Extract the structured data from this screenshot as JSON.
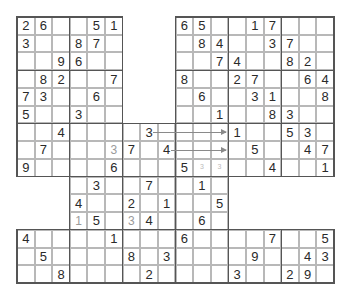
{
  "puzzle": {
    "type": "overlapping sudoku",
    "columns": 18,
    "rows": 15,
    "givens": [
      {
        "r": 0,
        "c": 0,
        "v": "2"
      },
      {
        "r": 0,
        "c": 1,
        "v": "6"
      },
      {
        "r": 0,
        "c": 4,
        "v": "5"
      },
      {
        "r": 0,
        "c": 5,
        "v": "1"
      },
      {
        "r": 0,
        "c": 9,
        "v": "6"
      },
      {
        "r": 0,
        "c": 10,
        "v": "5"
      },
      {
        "r": 0,
        "c": 13,
        "v": "1"
      },
      {
        "r": 0,
        "c": 14,
        "v": "7"
      },
      {
        "r": 1,
        "c": 0,
        "v": "3"
      },
      {
        "r": 1,
        "c": 3,
        "v": "8"
      },
      {
        "r": 1,
        "c": 4,
        "v": "7"
      },
      {
        "r": 1,
        "c": 10,
        "v": "8"
      },
      {
        "r": 1,
        "c": 11,
        "v": "4"
      },
      {
        "r": 1,
        "c": 14,
        "v": "3"
      },
      {
        "r": 1,
        "c": 15,
        "v": "7"
      },
      {
        "r": 2,
        "c": 2,
        "v": "9"
      },
      {
        "r": 2,
        "c": 3,
        "v": "6"
      },
      {
        "r": 2,
        "c": 11,
        "v": "7"
      },
      {
        "r": 2,
        "c": 12,
        "v": "4"
      },
      {
        "r": 2,
        "c": 15,
        "v": "8"
      },
      {
        "r": 2,
        "c": 16,
        "v": "2"
      },
      {
        "r": 3,
        "c": 1,
        "v": "8"
      },
      {
        "r": 3,
        "c": 2,
        "v": "2"
      },
      {
        "r": 3,
        "c": 5,
        "v": "7"
      },
      {
        "r": 3,
        "c": 9,
        "v": "8"
      },
      {
        "r": 3,
        "c": 12,
        "v": "2"
      },
      {
        "r": 3,
        "c": 13,
        "v": "7"
      },
      {
        "r": 3,
        "c": 16,
        "v": "6"
      },
      {
        "r": 3,
        "c": 17,
        "v": "4"
      },
      {
        "r": 4,
        "c": 0,
        "v": "7"
      },
      {
        "r": 4,
        "c": 1,
        "v": "3"
      },
      {
        "r": 4,
        "c": 4,
        "v": "6"
      },
      {
        "r": 4,
        "c": 10,
        "v": "6"
      },
      {
        "r": 4,
        "c": 13,
        "v": "3"
      },
      {
        "r": 4,
        "c": 14,
        "v": "1"
      },
      {
        "r": 4,
        "c": 17,
        "v": "8"
      },
      {
        "r": 5,
        "c": 0,
        "v": "5"
      },
      {
        "r": 5,
        "c": 3,
        "v": "3"
      },
      {
        "r": 5,
        "c": 11,
        "v": "1"
      },
      {
        "r": 5,
        "c": 14,
        "v": "8"
      },
      {
        "r": 5,
        "c": 15,
        "v": "3"
      },
      {
        "r": 6,
        "c": 2,
        "v": "4"
      },
      {
        "r": 6,
        "c": 7,
        "v": "3"
      },
      {
        "r": 6,
        "c": 12,
        "v": "1"
      },
      {
        "r": 6,
        "c": 15,
        "v": "5"
      },
      {
        "r": 6,
        "c": 16,
        "v": "3"
      },
      {
        "r": 7,
        "c": 1,
        "v": "7"
      },
      {
        "r": 7,
        "c": 6,
        "v": "7"
      },
      {
        "r": 7,
        "c": 8,
        "v": "4"
      },
      {
        "r": 7,
        "c": 13,
        "v": "5"
      },
      {
        "r": 7,
        "c": 16,
        "v": "4"
      },
      {
        "r": 7,
        "c": 17,
        "v": "7"
      },
      {
        "r": 8,
        "c": 0,
        "v": "9"
      },
      {
        "r": 8,
        "c": 5,
        "v": "6"
      },
      {
        "r": 8,
        "c": 9,
        "v": "5"
      },
      {
        "r": 8,
        "c": 14,
        "v": "4"
      },
      {
        "r": 8,
        "c": 17,
        "v": "1"
      },
      {
        "r": 9,
        "c": 4,
        "v": "3"
      },
      {
        "r": 9,
        "c": 7,
        "v": "7"
      },
      {
        "r": 9,
        "c": 10,
        "v": "1"
      },
      {
        "r": 10,
        "c": 3,
        "v": "4"
      },
      {
        "r": 10,
        "c": 6,
        "v": "2"
      },
      {
        "r": 10,
        "c": 8,
        "v": "1"
      },
      {
        "r": 10,
        "c": 11,
        "v": "5"
      },
      {
        "r": 11,
        "c": 4,
        "v": "5"
      },
      {
        "r": 11,
        "c": 7,
        "v": "4"
      },
      {
        "r": 11,
        "c": 10,
        "v": "6"
      },
      {
        "r": 12,
        "c": 0,
        "v": "4"
      },
      {
        "r": 12,
        "c": 5,
        "v": "1"
      },
      {
        "r": 12,
        "c": 9,
        "v": "6"
      },
      {
        "r": 12,
        "c": 14,
        "v": "7"
      },
      {
        "r": 12,
        "c": 17,
        "v": "5"
      },
      {
        "r": 13,
        "c": 1,
        "v": "5"
      },
      {
        "r": 13,
        "c": 6,
        "v": "8"
      },
      {
        "r": 13,
        "c": 8,
        "v": "3"
      },
      {
        "r": 13,
        "c": 13,
        "v": "9"
      },
      {
        "r": 13,
        "c": 16,
        "v": "4"
      },
      {
        "r": 13,
        "c": 17,
        "v": "3"
      },
      {
        "r": 14,
        "c": 2,
        "v": "8"
      },
      {
        "r": 14,
        "c": 7,
        "v": "2"
      },
      {
        "r": 14,
        "c": 12,
        "v": "3"
      },
      {
        "r": 14,
        "c": 15,
        "v": "2"
      },
      {
        "r": 14,
        "c": 16,
        "v": "9"
      }
    ],
    "pencil_entries": [
      {
        "r": 7,
        "c": 5,
        "v": "3"
      },
      {
        "r": 11,
        "c": 3,
        "v": "1"
      },
      {
        "r": 11,
        "c": 6,
        "v": "3"
      }
    ],
    "candidate_marks": [
      {
        "r": 8,
        "c": 10,
        "v": "3"
      },
      {
        "r": 8,
        "c": 11,
        "v": "3"
      }
    ],
    "arrows": [
      {
        "row": 6,
        "from_col": 7,
        "to_col": 12
      },
      {
        "row": 7,
        "from_col": 8,
        "to_col": 12
      }
    ]
  }
}
